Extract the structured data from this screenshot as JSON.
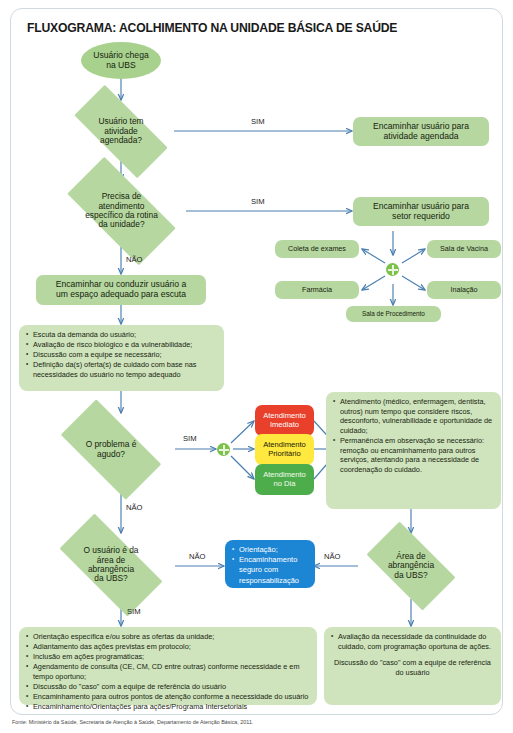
{
  "document": {
    "title": "FLUXOGRAMA: ACOLHIMENTO NA UNIDADE BÁSICA DE SAÚDE",
    "source_note": "Fonte: Ministério da Saúde, Secretaria de Atenção à Saúde, Departamento de Atenção Básica, 2011."
  },
  "colors": {
    "frame_border": "#cfd9e0",
    "node_green": "#b6d7a0",
    "ellipse_green": "#a9d18e",
    "list_green": "#cfe3bd",
    "arrow_blue": "#4a7fb0",
    "immediate_red": "#e8402a",
    "priority_yellow": "#ffe93f",
    "sameday_green": "#4ead4b",
    "orientation_blue": "#1c86d4",
    "hub_green": "#7cc24a"
  },
  "nodes": {
    "start": "Usuário chega\nna UBS",
    "d1": "Usuário tem\natividade\nagendada?",
    "d1_yes_box": "Encaminhar usuário para\natividade agendada",
    "d2": "Precisa de\natendimento\nespecífico da rotina\nda unidade?",
    "d2_yes_box": "Encaminhar usuário para\nsetor requerido",
    "sector_left_top": "Coleta de exames",
    "sector_right_top": "Sala de Vacina",
    "sector_left_bottom": "Farmácia",
    "sector_right_bottom": "Inalação",
    "sector_bottom": "Sala de Procedimento",
    "escuta_box": "Encaminhar ou conduzir usuário a\num espaço adequado para escuta",
    "d3": "O problema é\nagudo?",
    "care_immediate": "Atendimento\nImediato",
    "care_priority": "Atendimento\nPrioritário",
    "care_sameday": "Atendimento\nno Dia",
    "d4": "O usuário é da\nárea de\nabrangência\nda UBS?",
    "d5": "Área de\nabrangência\nda UBS?"
  },
  "lists": {
    "escuta_actions": [
      "Escuta da demanda do usuário;",
      "Avaliação de risco biológico e da vulnerabilidade;",
      "Discussão com a equipe se necessário;",
      "Definição da(s) oferta(s) de cuidado com base nas necessidades do usuário no tempo adequado"
    ],
    "acute_care": [
      "Atendimento (médico, enfermagem, dentista, outros) num tempo que considere riscos, desconforto, vulnerabilidade e oportunidade de cuidado;",
      "Permanência em observação se necessário: remoção ou encaminhamento para outros serviços, atentando para a necessidade de coordenação do cuidado."
    ],
    "orientation": [
      "Orientação;",
      "Encaminhamento seguro com responsabilização"
    ],
    "bottom_left": [
      "Orientação específica e/ou sobre as ofertas da unidade;",
      "Adiantamento das ações previstas em protocolo;",
      "Inclusão em ações programáticas;",
      "Agendamento de consulta (CE, CM, CD entre outras) conforme necessidade e em tempo oportuno;",
      "Discussão do \"caso\" com a equipe de referência do usuário",
      "Encaminhamento para outros pontos de atenção conforme a necessidade do usuário",
      "Encaminhamento/Orientações para ações/Programa Intersetoriais"
    ],
    "bottom_right": [
      "Avaliação da necessidade da continuidade do cuidado, com programação oportuna de ações."
    ],
    "bottom_right_plain": "Discussão do \"caso\" com a equipe de referência do usuário"
  },
  "edge_labels": {
    "sim1": "SIM",
    "sim2": "SIM",
    "nao1": "NÃO",
    "sim3": "SIM",
    "nao2": "NÃO",
    "nao3": "NÃO",
    "nao4": "NÃO",
    "sim4": "SIM"
  }
}
